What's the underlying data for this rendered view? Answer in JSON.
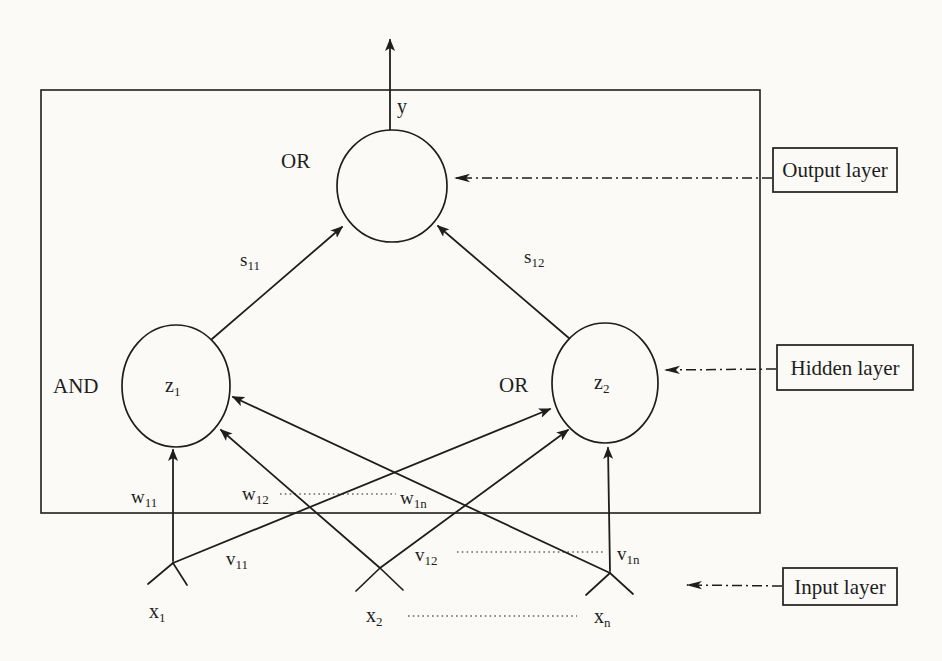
{
  "network": {
    "output_node": {
      "gate": "OR",
      "signal": "y"
    },
    "hidden_nodes": [
      {
        "gate": "AND",
        "name": {
          "base": "z",
          "sub": "1"
        }
      },
      {
        "gate": "OR",
        "name": {
          "base": "z",
          "sub": "2"
        }
      }
    ],
    "input_nodes": [
      {
        "name": {
          "base": "x",
          "sub": "1"
        }
      },
      {
        "name": {
          "base": "x",
          "sub": "2"
        }
      },
      {
        "name": {
          "base": "x",
          "sub": "n"
        }
      }
    ],
    "weights": {
      "s11": {
        "base": "s",
        "sub": "11"
      },
      "s12": {
        "base": "s",
        "sub": "12"
      },
      "w11": {
        "base": "w",
        "sub": "11"
      },
      "w12": {
        "base": "w",
        "sub": "12"
      },
      "w1n": {
        "base": "w",
        "sub": "1n"
      },
      "v11": {
        "base": "v",
        "sub": "11"
      },
      "v12": {
        "base": "v",
        "sub": "12"
      },
      "v1n": {
        "base": "v",
        "sub": "1n"
      }
    },
    "callouts": {
      "output": "Output layer",
      "hidden": "Hidden layer",
      "input": "Input layer"
    },
    "colors": {
      "ink": "#1e1e1e",
      "paper": "#fbfaf6"
    }
  }
}
